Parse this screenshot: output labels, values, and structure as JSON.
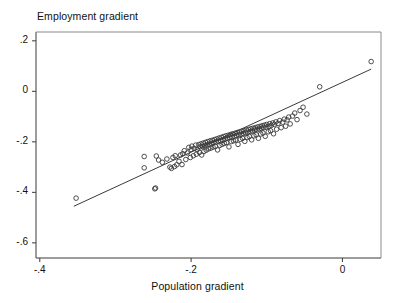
{
  "chart_data": {
    "type": "scatter",
    "title": "",
    "xlabel": "Population gradient",
    "ylabel": "Employment gradient",
    "xlim": [
      -0.405,
      0.051
    ],
    "ylim": [
      -0.66,
      0.235
    ],
    "xticks": [
      -0.4,
      -0.2,
      0
    ],
    "xticklabels": [
      "-.4",
      "-.2",
      "0"
    ],
    "yticks": [
      0.2,
      0,
      -0.2,
      -0.4,
      -0.6
    ],
    "yticklabels": [
      ".2",
      "0",
      "-.2",
      "-.4",
      "-.6"
    ],
    "grid": false,
    "legend": null,
    "marker": "open-circle",
    "marker_size": 3,
    "marker_color": "#3a3a3a",
    "line_color": "#3a3a3a",
    "frame": true,
    "fit_line": {
      "name": "linear fit",
      "x": [
        -0.355,
        0.038
      ],
      "y": [
        -0.455,
        0.088
      ],
      "slope": 1.381,
      "intercept": 0.0355
    },
    "x": [
      -0.352,
      -0.262,
      -0.262,
      -0.248,
      -0.247,
      -0.246,
      -0.243,
      -0.238,
      -0.232,
      -0.228,
      -0.226,
      -0.224,
      -0.222,
      -0.221,
      -0.219,
      -0.216,
      -0.214,
      -0.212,
      -0.211,
      -0.209,
      -0.207,
      -0.205,
      -0.203,
      -0.201,
      -0.2,
      -0.199,
      -0.197,
      -0.196,
      -0.194,
      -0.193,
      -0.192,
      -0.19,
      -0.189,
      -0.188,
      -0.187,
      -0.186,
      -0.185,
      -0.184,
      -0.183,
      -0.182,
      -0.181,
      -0.18,
      -0.179,
      -0.178,
      -0.177,
      -0.176,
      -0.175,
      -0.174,
      -0.173,
      -0.172,
      -0.171,
      -0.17,
      -0.169,
      -0.168,
      -0.167,
      -0.166,
      -0.165,
      -0.164,
      -0.163,
      -0.162,
      -0.161,
      -0.16,
      -0.159,
      -0.158,
      -0.157,
      -0.156,
      -0.155,
      -0.154,
      -0.153,
      -0.152,
      -0.151,
      -0.15,
      -0.149,
      -0.148,
      -0.147,
      -0.146,
      -0.145,
      -0.144,
      -0.143,
      -0.142,
      -0.141,
      -0.14,
      -0.139,
      -0.138,
      -0.137,
      -0.136,
      -0.135,
      -0.134,
      -0.133,
      -0.132,
      -0.131,
      -0.13,
      -0.129,
      -0.128,
      -0.127,
      -0.126,
      -0.125,
      -0.124,
      -0.123,
      -0.122,
      -0.121,
      -0.12,
      -0.119,
      -0.118,
      -0.117,
      -0.116,
      -0.115,
      -0.114,
      -0.113,
      -0.112,
      -0.111,
      -0.11,
      -0.109,
      -0.108,
      -0.107,
      -0.106,
      -0.105,
      -0.104,
      -0.103,
      -0.102,
      -0.101,
      -0.1,
      -0.098,
      -0.097,
      -0.096,
      -0.095,
      -0.094,
      -0.092,
      -0.091,
      -0.09,
      -0.088,
      -0.087,
      -0.085,
      -0.083,
      -0.081,
      -0.079,
      -0.077,
      -0.075,
      -0.073,
      -0.071,
      -0.069,
      -0.066,
      -0.063,
      -0.06,
      -0.056,
      -0.052,
      -0.047,
      -0.03,
      0.038
    ],
    "y": [
      -0.423,
      -0.303,
      -0.258,
      -0.386,
      -0.383,
      -0.256,
      -0.272,
      -0.281,
      -0.268,
      -0.3,
      -0.305,
      -0.262,
      -0.298,
      -0.255,
      -0.291,
      -0.277,
      -0.252,
      -0.29,
      -0.247,
      -0.235,
      -0.27,
      -0.244,
      -0.222,
      -0.262,
      -0.23,
      -0.217,
      -0.255,
      -0.226,
      -0.213,
      -0.249,
      -0.231,
      -0.211,
      -0.242,
      -0.22,
      -0.208,
      -0.252,
      -0.218,
      -0.205,
      -0.238,
      -0.215,
      -0.202,
      -0.233,
      -0.212,
      -0.199,
      -0.228,
      -0.209,
      -0.196,
      -0.225,
      -0.206,
      -0.194,
      -0.221,
      -0.203,
      -0.191,
      -0.218,
      -0.2,
      -0.188,
      -0.232,
      -0.197,
      -0.185,
      -0.214,
      -0.195,
      -0.182,
      -0.21,
      -0.192,
      -0.179,
      -0.206,
      -0.189,
      -0.176,
      -0.203,
      -0.186,
      -0.174,
      -0.22,
      -0.183,
      -0.171,
      -0.199,
      -0.181,
      -0.168,
      -0.196,
      -0.178,
      -0.166,
      -0.193,
      -0.175,
      -0.163,
      -0.21,
      -0.172,
      -0.161,
      -0.19,
      -0.17,
      -0.158,
      -0.186,
      -0.167,
      -0.156,
      -0.198,
      -0.164,
      -0.153,
      -0.183,
      -0.162,
      -0.151,
      -0.179,
      -0.159,
      -0.148,
      -0.192,
      -0.157,
      -0.146,
      -0.176,
      -0.154,
      -0.144,
      -0.172,
      -0.152,
      -0.141,
      -0.186,
      -0.149,
      -0.139,
      -0.169,
      -0.147,
      -0.136,
      -0.165,
      -0.144,
      -0.134,
      -0.178,
      -0.142,
      -0.131,
      -0.16,
      -0.139,
      -0.128,
      -0.156,
      -0.135,
      -0.125,
      -0.168,
      -0.131,
      -0.121,
      -0.15,
      -0.127,
      -0.116,
      -0.144,
      -0.122,
      -0.11,
      -0.138,
      -0.113,
      -0.102,
      -0.129,
      -0.098,
      -0.086,
      -0.112,
      -0.076,
      -0.063,
      -0.09,
      0.018,
      0.118
    ]
  }
}
